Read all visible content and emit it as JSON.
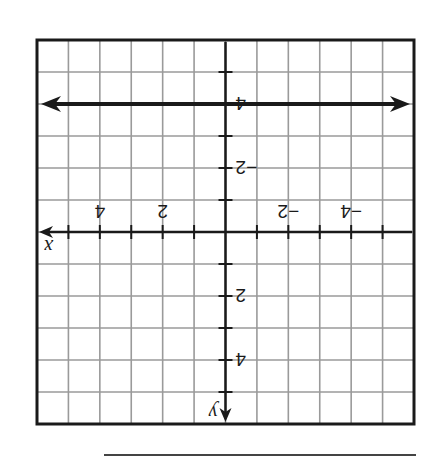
{
  "chart_data": {
    "type": "line",
    "title": "",
    "xlabel": "x",
    "ylabel": "y",
    "xlim": [
      -6,
      6
    ],
    "ylim": [
      -6,
      6
    ],
    "grid": true,
    "x_tick_labels": [
      {
        "value": -4,
        "label": "−4"
      },
      {
        "value": -2,
        "label": "−2"
      },
      {
        "value": 2,
        "label": "2"
      },
      {
        "value": 4,
        "label": "4"
      }
    ],
    "y_tick_labels": [
      {
        "value": -4,
        "label": "−4"
      },
      {
        "value": -2,
        "label": "−2"
      },
      {
        "value": 2,
        "label": "2"
      },
      {
        "value": 4,
        "label": "4"
      }
    ],
    "series": [
      {
        "name": "y = -4",
        "kind": "horizontal-line",
        "y": -4,
        "x": [
          -6,
          6
        ],
        "arrows": "both"
      }
    ],
    "orientation": "rotated-180",
    "answer_line": true
  }
}
